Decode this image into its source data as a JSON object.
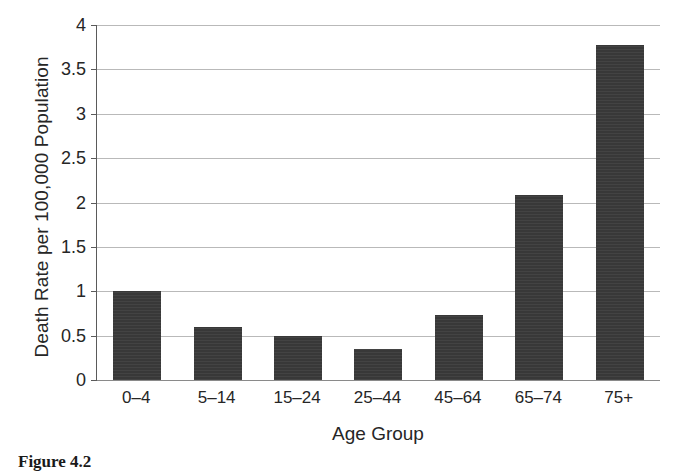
{
  "chart_data": {
    "type": "bar",
    "title": "",
    "xlabel": "Age Group",
    "ylabel": "Death Rate per 100,000 Population",
    "categories": [
      "0–4",
      "5–14",
      "15–24",
      "25–44",
      "45–64",
      "65–74",
      "75+"
    ],
    "values": [
      1.0,
      0.6,
      0.5,
      0.35,
      0.73,
      2.08,
      3.78
    ],
    "ylim": [
      0,
      4
    ],
    "yticks": [
      0,
      0.5,
      1,
      1.5,
      2,
      2.5,
      3,
      3.5,
      4
    ],
    "ytick_labels": [
      "0",
      "0.5",
      "1",
      "1.5",
      "2",
      "2.5",
      "3",
      "3.5",
      "4"
    ],
    "grid": true,
    "legend": false,
    "legend_position": "none",
    "bar_color": "#3b3b3b",
    "axis_color": "#5a5a5a",
    "grid_color": "#b9b9b9"
  },
  "caption": {
    "label": "Figure 4.2",
    "text": ""
  }
}
